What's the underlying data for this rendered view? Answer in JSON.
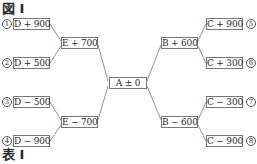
{
  "figure_title": "図 I",
  "table_title": "表 I",
  "center": {
    "label": "A ± 0"
  },
  "left": {
    "upper": {
      "label": "E + 700",
      "leaves": [
        {
          "num": "1",
          "label": "D + 900"
        },
        {
          "num": "2",
          "label": "D + 500"
        }
      ]
    },
    "lower": {
      "label": "E − 700",
      "leaves": [
        {
          "num": "3",
          "label": "D − 500"
        },
        {
          "num": "4",
          "label": "D − 900"
        }
      ]
    }
  },
  "right": {
    "upper": {
      "label": "B + 600",
      "leaves": [
        {
          "num": "5",
          "label": "C + 900"
        },
        {
          "num": "6",
          "label": "C + 300"
        }
      ]
    },
    "lower": {
      "label": "B − 600",
      "leaves": [
        {
          "num": "7",
          "label": "C − 300"
        },
        {
          "num": "8",
          "label": "C − 900"
        }
      ]
    }
  },
  "colors": {
    "line": "#777777",
    "text": "#2a2a2a"
  }
}
